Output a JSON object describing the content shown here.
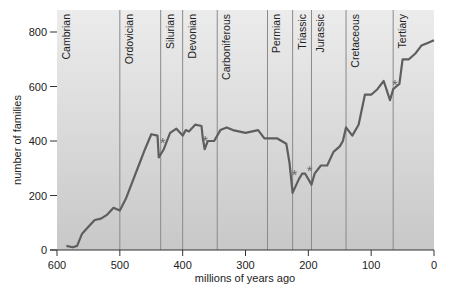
{
  "chart_data": {
    "type": "line",
    "title": "",
    "xlabel": "millions of years ago",
    "ylabel": "number of families",
    "xlim": [
      600,
      0
    ],
    "ylim": [
      0,
      800
    ],
    "x_ticks": [
      600,
      500,
      400,
      300,
      200,
      100,
      0
    ],
    "y_ticks": [
      0,
      200,
      400,
      600,
      800
    ],
    "grid": false,
    "legend": null,
    "periods": [
      {
        "name": "Cambrian",
        "start": 590
      },
      {
        "name": "Ordovician",
        "start": 500
      },
      {
        "name": "Silurian",
        "start": 435
      },
      {
        "name": "Devonian",
        "start": 400
      },
      {
        "name": "Carboniferous",
        "start": 345
      },
      {
        "name": "Permian",
        "start": 265
      },
      {
        "name": "Triassic",
        "start": 225
      },
      {
        "name": "Jurassic",
        "start": 195
      },
      {
        "name": "Cretaceous",
        "start": 140
      },
      {
        "name": "Tertiary",
        "start": 65
      }
    ],
    "series": [
      {
        "name": "number of families",
        "x": [
          585,
          575,
          568,
          560,
          550,
          540,
          530,
          520,
          510,
          500,
          490,
          480,
          470,
          460,
          450,
          440,
          438,
          430,
          420,
          410,
          400,
          395,
          390,
          380,
          370,
          368,
          365,
          360,
          350,
          340,
          330,
          320,
          300,
          280,
          270,
          250,
          235,
          230,
          225,
          215,
          210,
          205,
          195,
          190,
          180,
          170,
          160,
          150,
          145,
          140,
          130,
          120,
          110,
          100,
          90,
          80,
          70,
          65,
          60,
          55,
          50,
          40,
          30,
          20,
          10,
          0
        ],
        "y": [
          15,
          10,
          15,
          60,
          85,
          110,
          115,
          130,
          155,
          145,
          190,
          250,
          310,
          370,
          425,
          420,
          340,
          370,
          430,
          445,
          420,
          440,
          435,
          460,
          455,
          410,
          370,
          400,
          400,
          440,
          450,
          440,
          430,
          440,
          410,
          410,
          390,
          320,
          210,
          260,
          280,
          280,
          240,
          280,
          310,
          310,
          360,
          380,
          400,
          450,
          420,
          460,
          570,
          570,
          590,
          620,
          550,
          590,
          600,
          610,
          700,
          700,
          720,
          750,
          760,
          770
        ]
      }
    ],
    "annotations": [
      {
        "text": "*",
        "x": 432,
        "y": 405,
        "meaning": "mass extinction (end-Ordovician)"
      },
      {
        "text": "*",
        "x": 364,
        "y": 410,
        "meaning": "mass extinction (late Devonian)"
      },
      {
        "text": "*",
        "x": 222,
        "y": 285,
        "meaning": "mass extinction (end-Permian)"
      },
      {
        "text": "*",
        "x": 198,
        "y": 300,
        "meaning": "mass extinction (end-Triassic)"
      },
      {
        "text": "*",
        "x": 62,
        "y": 615,
        "meaning": "mass extinction (end-Cretaceous)"
      }
    ]
  },
  "colors": {
    "line": "#5e5e5e",
    "plot_bg_top": "#eaeaea",
    "plot_bg_bottom": "#c9c9c9",
    "divider": "#8a8a8a",
    "axis": "#333333"
  }
}
